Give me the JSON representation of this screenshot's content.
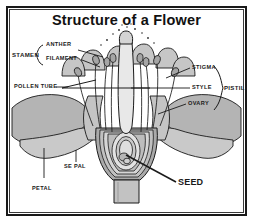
{
  "figure": {
    "title": "Structure of a Flower",
    "type": "botanical-cross-section-diagram",
    "border_color": "#1a1a1a",
    "background_color": "#ffffff",
    "tissue_fill": "#b0b0b0",
    "tissue_fill_light": "#d2d2d2",
    "outline_color": "#1a1a1a"
  },
  "labels": {
    "stamen": "STAMEN",
    "anther": "ANTHER",
    "filament": "FILAMENT",
    "pollen_tube": "POLLEN TUBE",
    "stigma": "STIGMA",
    "style": "STYLE",
    "ovary": "OVARY",
    "pistil": "PISTIL",
    "sepal": "SE PAL",
    "petal": "PETAL",
    "seed": "SEED"
  },
  "groupings": {
    "stamen_parts": [
      "ANTHER",
      "FILAMENT"
    ],
    "pistil_parts": [
      "STIGMA",
      "STYLE",
      "OVARY"
    ]
  }
}
